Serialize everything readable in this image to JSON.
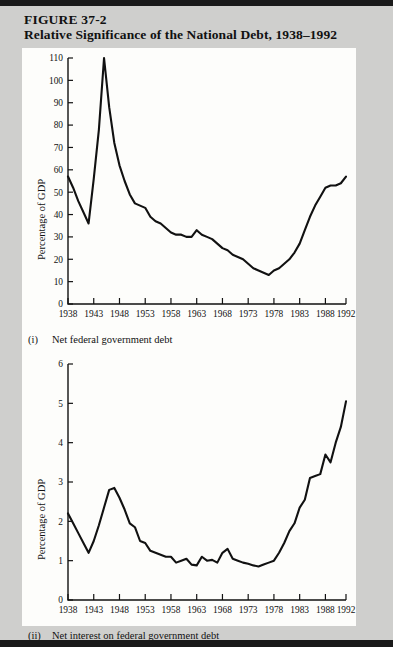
{
  "figure": {
    "number": "FIGURE 37-2",
    "title": "Relative Significance of the National Debt, 1938–1992"
  },
  "panels": [
    {
      "caption_numeral": "(i)",
      "caption_text": "Net federal government debt",
      "ylabel": "Percentage of GDP"
    },
    {
      "caption_numeral": "(ii)",
      "caption_text": "Net interest on federal government debt",
      "ylabel": "Percentage of GDP"
    }
  ],
  "chart_data": [
    {
      "type": "line",
      "title": "Net federal government debt",
      "xlabel": "",
      "ylabel": "Percentage of GDP",
      "xlim": [
        1938,
        1992
      ],
      "ylim": [
        0,
        110
      ],
      "yticks": [
        0,
        10,
        20,
        30,
        40,
        50,
        60,
        70,
        80,
        90,
        100,
        110
      ],
      "xticks": [
        1938,
        1943,
        1948,
        1953,
        1958,
        1963,
        1968,
        1973,
        1978,
        1983,
        1988,
        1992
      ],
      "grid": false,
      "legend": null,
      "x": [
        1938,
        1939,
        1940,
        1941,
        1942,
        1943,
        1944,
        1945,
        1946,
        1947,
        1948,
        1949,
        1950,
        1951,
        1952,
        1953,
        1954,
        1955,
        1956,
        1957,
        1958,
        1959,
        1960,
        1961,
        1962,
        1963,
        1964,
        1965,
        1966,
        1967,
        1968,
        1969,
        1970,
        1971,
        1972,
        1973,
        1974,
        1975,
        1976,
        1977,
        1978,
        1979,
        1980,
        1981,
        1982,
        1983,
        1984,
        1985,
        1986,
        1987,
        1988,
        1989,
        1990,
        1991,
        1992
      ],
      "values": [
        57,
        52,
        46,
        41,
        36,
        56,
        78,
        110,
        88,
        72,
        62,
        55,
        49,
        45,
        44,
        43,
        39,
        37,
        36,
        34,
        32,
        31,
        31,
        30,
        30,
        33,
        31,
        30,
        29,
        27,
        25,
        24,
        22,
        21,
        20,
        18,
        16,
        15,
        14,
        13,
        15,
        16,
        18,
        20,
        23,
        27,
        33,
        39,
        44,
        48,
        52,
        53,
        53,
        54,
        57
      ]
    },
    {
      "type": "line",
      "title": "Net interest on federal government debt",
      "xlabel": "",
      "ylabel": "Percentage of GDP",
      "xlim": [
        1938,
        1992
      ],
      "ylim": [
        0,
        6
      ],
      "yticks": [
        0,
        1,
        2,
        3,
        4,
        5,
        6
      ],
      "xticks": [
        1938,
        1943,
        1948,
        1953,
        1958,
        1963,
        1968,
        1973,
        1978,
        1983,
        1988,
        1992
      ],
      "grid": false,
      "legend": null,
      "x": [
        1938,
        1939,
        1940,
        1941,
        1942,
        1943,
        1944,
        1945,
        1946,
        1947,
        1948,
        1949,
        1950,
        1951,
        1952,
        1953,
        1954,
        1955,
        1956,
        1957,
        1958,
        1959,
        1960,
        1961,
        1962,
        1963,
        1964,
        1965,
        1966,
        1967,
        1968,
        1969,
        1970,
        1971,
        1972,
        1973,
        1974,
        1975,
        1976,
        1977,
        1978,
        1979,
        1980,
        1981,
        1982,
        1983,
        1984,
        1985,
        1986,
        1987,
        1988,
        1989,
        1990,
        1991,
        1992
      ],
      "values": [
        2.2,
        1.95,
        1.7,
        1.45,
        1.2,
        1.5,
        1.9,
        2.35,
        2.8,
        2.85,
        2.6,
        2.3,
        1.95,
        1.85,
        1.5,
        1.45,
        1.25,
        1.2,
        1.15,
        1.1,
        1.1,
        0.95,
        1.0,
        1.05,
        0.9,
        0.88,
        1.1,
        1.0,
        1.02,
        0.95,
        1.2,
        1.3,
        1.05,
        1.0,
        0.95,
        0.92,
        0.88,
        0.85,
        0.9,
        0.95,
        1.0,
        1.2,
        1.45,
        1.75,
        1.95,
        2.35,
        2.55,
        3.1,
        3.15,
        3.2,
        3.7,
        3.5,
        4.0,
        4.4,
        5.05,
        6.05,
        5.75
      ]
    }
  ]
}
